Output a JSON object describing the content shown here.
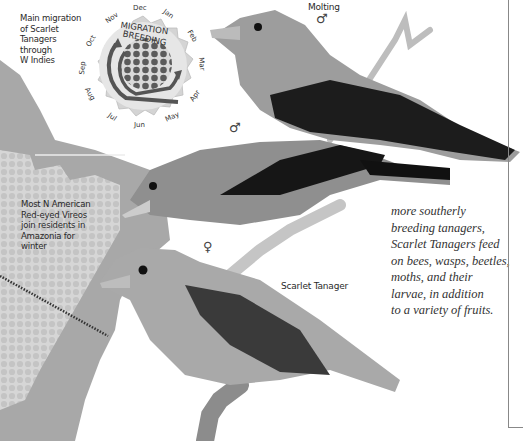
{
  "map": {
    "migration_caption": "Main migration of Scarlet Tanagers through W Indies",
    "migration_caption_lines": [
      "Main migration",
      "of Scarlet",
      "Tanagers",
      "through",
      "W Indies"
    ],
    "vireo_caption_lines": [
      "Most N American",
      "Red-eyed Vireos",
      "join residents in",
      "Amazonia for",
      "winter"
    ],
    "colors": {
      "land": "#a9a9a9",
      "habitat": "#d4d4d4",
      "dots": "#c2c2c2",
      "route": "#333333"
    }
  },
  "calendar_wheel": {
    "outer_label": "MIGRATION",
    "inner_label": "BREEDING",
    "months": [
      "Dec",
      "Jan",
      "Feb",
      "Mar",
      "Apr",
      "May",
      "Jun",
      "Jul",
      "Aug",
      "Sep",
      "Oct",
      "Nov"
    ],
    "colors": {
      "rim": "#d8d8d8",
      "arrow": "#555555",
      "dots": "#5a5a5a"
    }
  },
  "birds": [
    {
      "name": "molting-male",
      "label": "Molting",
      "sex_symbol": "♂"
    },
    {
      "name": "breeding-male",
      "label": "",
      "sex_symbol": "♂"
    },
    {
      "name": "female",
      "label": "",
      "sex_symbol": "♀"
    }
  ],
  "species_label": "Scarlet Tanager",
  "body_text_lines": [
    "more southerly",
    "breeding tanagers,",
    "Scarlet Tanagers feed",
    "on bees, wasps, beetles,",
    "moths, and their",
    "larvae, in addition",
    "to a variety of fruits."
  ]
}
